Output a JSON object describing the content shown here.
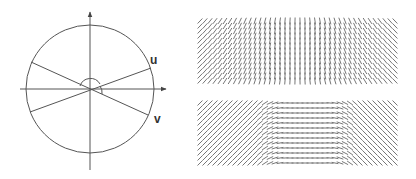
{
  "figure": {
    "left_panel": {
      "description": "circle with axes and two lines u and v through origin",
      "labels": {
        "u": "u",
        "v": "v"
      },
      "circle": {
        "cx": 90,
        "cy": 89,
        "r": 64
      },
      "colors": {
        "stroke": "#555555"
      }
    },
    "right_panel": {
      "top_field": {
        "x": 197,
        "y": 18,
        "width": 200,
        "height": 66,
        "pattern": "slant-left-to-vertical-to-slant-right"
      },
      "bottom_field": {
        "x": 197,
        "y": 100,
        "width": 200,
        "height": 66,
        "pattern": "slant-to-horizontal-to-slant"
      },
      "colors": {
        "stroke": "#777777"
      }
    }
  }
}
